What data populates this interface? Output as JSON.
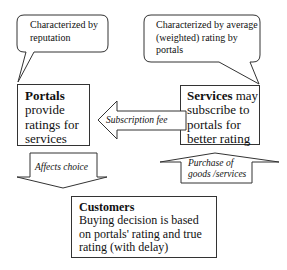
{
  "callouts": {
    "left": {
      "text": "Characterized by reputation",
      "line1": "Characterized by",
      "line2": "reputation"
    },
    "right": {
      "text": "Characterized by average (weighted) rating by portals",
      "line1": "Characterized by average",
      "line2": "(weighted) rating by",
      "line3": "portals"
    }
  },
  "nodes": {
    "portals": {
      "title": "Portals",
      "line1": "provide",
      "line2": "ratings for",
      "line3": "services"
    },
    "services": {
      "title": "Services",
      "title_rest": " may",
      "line1": "subscribe to",
      "line2": "portals for",
      "line3": "better rating"
    },
    "customers": {
      "title": "Customers",
      "line1": "Buying decision is based",
      "line2": "on portals' rating and true",
      "line3": "rating (with delay)"
    }
  },
  "arrows": {
    "subscription": {
      "label": "Subscription fee",
      "direction": "left",
      "from": "Services",
      "to": "Portals"
    },
    "purchase": {
      "line1": "Purchase of",
      "line2": "goods /services",
      "direction": "up",
      "from": "Customers",
      "to": "Services"
    },
    "affects": {
      "label": "Affects choice",
      "direction": "down",
      "from": "Portals",
      "to": "Customers"
    }
  },
  "colors": {
    "stroke": "#333333",
    "background": "#ffffff",
    "text": "#111111"
  }
}
